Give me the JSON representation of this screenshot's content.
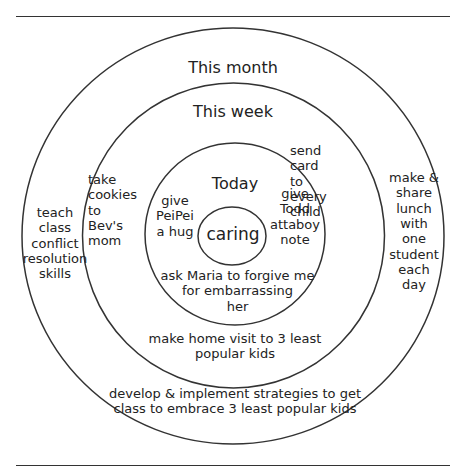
{
  "diagram": {
    "type": "concentric-circles",
    "colors": {
      "stroke": "#333333",
      "text": "#222222",
      "background": "#ffffff"
    },
    "rings": {
      "month": {
        "title": "This month",
        "items": [
          "teach\nclass\nconflict\nresolution\nskills",
          "make &\nshare\nlunch\nwith\none\nstudent\neach\nday",
          "develop & implement strategies to get\nclass to embrace 3 least popular kids"
        ]
      },
      "week": {
        "title": "This week",
        "items": [
          "take\ncookies\nto\nBev's\nmom",
          "send\n card\n  to\n every\n child",
          "make home visit to 3 least\npopular kids"
        ]
      },
      "today": {
        "title": "Today",
        "items": [
          "give\nPeiPei\na hug",
          "give\nTodd\nattaboy\nnote",
          "ask Maria to forgive me\nfor embarrassing\nher"
        ]
      },
      "core": {
        "title": "caring"
      }
    }
  }
}
